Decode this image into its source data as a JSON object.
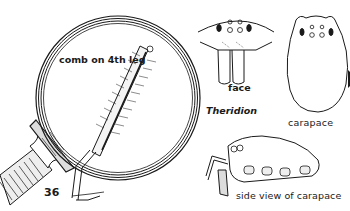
{
  "page": {
    "number": "36",
    "genus": "Theridion"
  },
  "figures": {
    "magnifier": {
      "label": "comb on 4th leg",
      "icon": "magnifying-glass-icon"
    },
    "face": {
      "label": "face"
    },
    "carapace": {
      "label": "carapace"
    },
    "side_view": {
      "label": "side view of carapace"
    }
  },
  "colors": {
    "ink": "#1a1a1a",
    "paper": "#ffffff"
  }
}
